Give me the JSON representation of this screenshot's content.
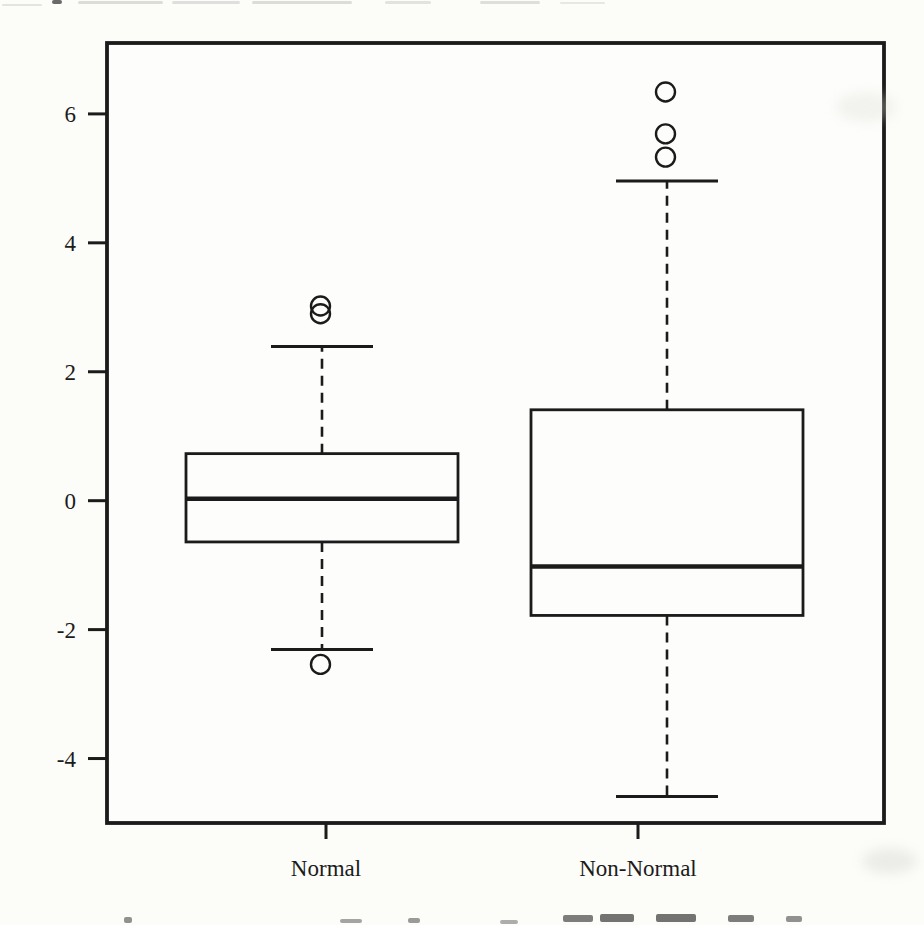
{
  "page": {
    "background": "#fcfcf9",
    "ink": "#1b1b1b",
    "artifacts": {
      "top_edge_cutoff_text": "illegible — bottoms of a cropped text line at top edge",
      "bottom_edge_cutoff_text": "illegible — tops of a cropped caption line at bottom edge"
    }
  },
  "chart_data": {
    "type": "boxplot",
    "orientation": "vertical",
    "title": "",
    "xlabel": "",
    "ylabel": "",
    "categories": [
      "Normal",
      "Non-Normal"
    ],
    "y_axis": {
      "min": -5.0,
      "max": 7.1,
      "ticks": [
        -4,
        -2,
        0,
        2,
        4,
        6
      ],
      "tick_labels": [
        "-4",
        "-2",
        "0",
        "2",
        "4",
        "6"
      ],
      "grid": false
    },
    "series": [
      {
        "name": "Normal",
        "stats": {
          "whisker_low": -2.31,
          "q1": -0.64,
          "median": 0.03,
          "q3": 0.73,
          "whisker_high": 2.39
        },
        "outliers": [
          -2.54,
          2.9,
          3.02
        ]
      },
      {
        "name": "Non-Normal",
        "stats": {
          "whisker_low": -4.59,
          "q1": -1.78,
          "median": -1.02,
          "q3": 1.41,
          "whisker_high": 4.96
        },
        "outliers": [
          5.33,
          5.69,
          6.34
        ]
      }
    ],
    "style": {
      "box_fill": "white",
      "whisker_line": "dashed",
      "outlier_marker": "open-circle",
      "legend": "none"
    }
  }
}
